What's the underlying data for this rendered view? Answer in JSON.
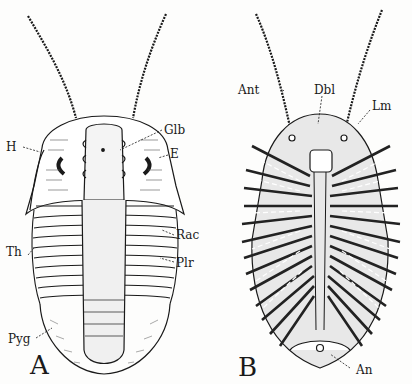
{
  "figure": {
    "panels": [
      {
        "id": "A",
        "letter": "A",
        "view": "dorsal",
        "labels": {
          "H": "H",
          "Glb": "Glb",
          "E": "E",
          "Th": "Th",
          "Rac": "Rac",
          "Plr": "Plr",
          "Pyg": "Pyg"
        }
      },
      {
        "id": "B",
        "letter": "B",
        "view": "ventral",
        "labels": {
          "Ant": "Ant",
          "Dbl": "Dbl",
          "Lm": "Lm",
          "An": "An"
        }
      }
    ],
    "colors": {
      "ink": "#1a1a1a",
      "paper": "#fdfdfc"
    }
  }
}
